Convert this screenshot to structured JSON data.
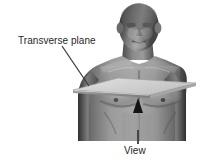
{
  "figure": {
    "type": "anatomical-illustration",
    "background_color": "#ffffff",
    "labels": {
      "plane_label": "Transverse plane",
      "view_label": "View"
    },
    "annotations": {
      "plane_leader_line": "line from the 'Transverse plane' text down-right to the left edge of the plane",
      "view_arrow": "vertical arrow pointing up from below the torso toward the transverse plane"
    },
    "colors": {
      "text": "#272727",
      "leader_line": "#3a3a3a",
      "arrow": "#1a1a1a",
      "plane_top": "#d9d9d9",
      "plane_edge": "#8e8e8e",
      "skin_mid": "#8a8a8a",
      "skin_dark": "#3c3c3c",
      "skin_light": "#c8c8c8"
    }
  }
}
